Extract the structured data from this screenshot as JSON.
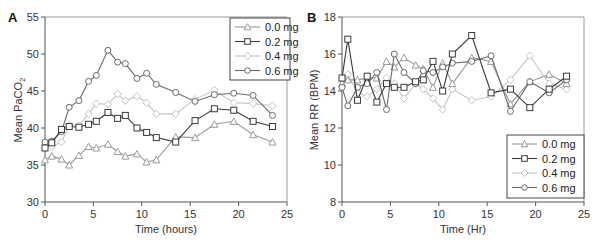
{
  "chart_data": [
    {
      "type": "line",
      "panel": "A",
      "title": "",
      "xlabel": "Time (hours)",
      "ylabel": "Mean PaCO2",
      "xlim": [
        0,
        25
      ],
      "ylim": [
        30,
        55
      ],
      "xticks": [
        0,
        5,
        10,
        15,
        20,
        25
      ],
      "yticks": [
        30,
        35,
        40,
        45,
        50,
        55
      ],
      "grid": false,
      "legend_position": "upper right",
      "x": [
        0,
        0.7,
        1.7,
        2.5,
        3.5,
        4.5,
        5.3,
        6.5,
        7.5,
        8.3,
        9.5,
        10.5,
        11.5,
        13.5,
        15.5,
        17.5,
        19.5,
        21.5,
        23.5
      ],
      "series": [
        {
          "name": "0.0 mg",
          "marker": "triangle",
          "color": "#9a9a9a",
          "values": [
            35.7,
            36.2,
            35.8,
            35.0,
            36.3,
            37.5,
            37.3,
            37.8,
            36.8,
            36.2,
            36.5,
            35.4,
            35.7,
            38.8,
            38.7,
            40.5,
            40.9,
            39.1,
            38.1
          ]
        },
        {
          "name": "0.2 mg",
          "marker": "square",
          "color": "#3a3a3a",
          "values": [
            37.3,
            38.0,
            39.8,
            40.2,
            40.1,
            40.5,
            40.9,
            42.1,
            41.3,
            41.7,
            40.0,
            39.4,
            38.7,
            38.1,
            41.0,
            42.6,
            42.4,
            40.9,
            40.2
          ]
        },
        {
          "name": "0.4 mg",
          "marker": "diamond",
          "color": "#c4c4c4",
          "values": [
            38.1,
            37.5,
            38.1,
            40.4,
            40.3,
            41.9,
            43.3,
            43.2,
            44.6,
            43.7,
            44.3,
            43.4,
            41.9,
            41.9,
            43.9,
            45.1,
            43.4,
            43.3,
            43.0
          ]
        },
        {
          "name": "0.6 mg",
          "marker": "circle",
          "color": "#6a6a6a",
          "values": [
            38.1,
            38.2,
            39.5,
            42.8,
            43.7,
            46.3,
            47.1,
            50.5,
            48.9,
            48.7,
            46.7,
            47.4,
            45.9,
            44.8,
            43.6,
            44.5,
            44.7,
            44.4,
            41.7
          ]
        }
      ]
    },
    {
      "type": "line",
      "panel": "B",
      "title": "",
      "xlabel": "Time (Hr)",
      "ylabel": "Mean RR (BPM)",
      "xlim": [
        0,
        25
      ],
      "ylim": [
        8,
        18
      ],
      "xticks": [
        0,
        5,
        10,
        15,
        20,
        25
      ],
      "yticks": [
        8,
        10,
        12,
        14,
        16,
        18
      ],
      "grid": false,
      "legend_position": "lower right",
      "x": [
        0,
        0.6,
        1.6,
        2.6,
        3.6,
        4.6,
        5.4,
        6.4,
        7.6,
        8.4,
        9.4,
        10.4,
        11.4,
        13.4,
        15.4,
        17.4,
        19.4,
        21.4,
        23.2
      ],
      "series": [
        {
          "name": "0.0 mg",
          "marker": "triangle",
          "color": "#9a9a9a",
          "values": [
            14.4,
            14.6,
            14.6,
            14.7,
            14.7,
            15.6,
            15.3,
            15.8,
            15.4,
            15.2,
            14.2,
            15.5,
            14.4,
            15.8,
            15.6,
            13.3,
            14.5,
            14.9,
            14.4
          ]
        },
        {
          "name": "0.2 mg",
          "marker": "square",
          "color": "#3a3a3a",
          "values": [
            14.7,
            16.8,
            13.5,
            14.8,
            13.4,
            14.4,
            14.2,
            14.2,
            14.5,
            14.6,
            15.6,
            14.0,
            16.0,
            17.0,
            13.9,
            14.1,
            13.1,
            14.1,
            14.8
          ]
        },
        {
          "name": "0.4 mg",
          "marker": "diamond",
          "color": "#c4c4c4",
          "values": [
            14.5,
            14.9,
            13.9,
            13.7,
            14.1,
            14.7,
            14.4,
            13.6,
            14.4,
            14.1,
            13.6,
            13.0,
            14.1,
            13.5,
            13.7,
            14.6,
            15.9,
            14.4,
            14.1
          ]
        },
        {
          "name": "0.6 mg",
          "marker": "circle",
          "color": "#6a6a6a",
          "values": [
            14.2,
            13.2,
            14.2,
            14.4,
            15.0,
            13.0,
            16.0,
            15.0,
            14.4,
            15.1,
            15.0,
            15.3,
            15.5,
            15.6,
            15.9,
            12.9,
            14.5,
            13.9,
            14.6
          ]
        }
      ]
    }
  ],
  "panels": {
    "a": {
      "label": "A",
      "xlabel": "Time (hours)",
      "ylabel_main": "Mean PaCO",
      "ylabel_sub": "2"
    },
    "b": {
      "label": "B",
      "xlabel": "Time (Hr)",
      "ylabel_main": "Mean RR (BPM)"
    }
  },
  "legend": [
    "0.0 mg",
    "0.2 mg",
    "0.4 mg",
    "0.6 mg"
  ]
}
